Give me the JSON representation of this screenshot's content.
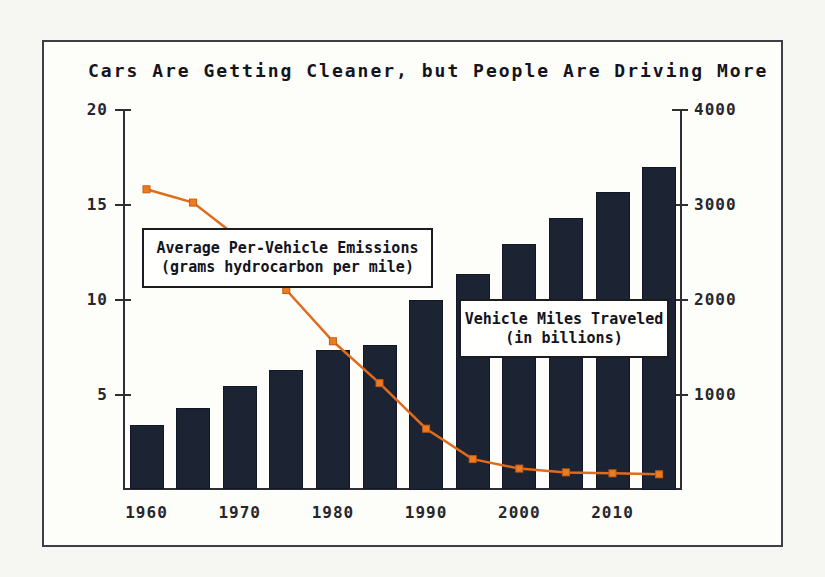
{
  "chart": {
    "title": "Cars Are Getting Cleaner, but People Are Driving More",
    "colors": {
      "bar": "#1c2433",
      "line": "#e06b1c",
      "marker_fill": "#ea7d22",
      "marker_stroke": "#c85a10",
      "axis": "#2e2e34",
      "frame_border": "#3e3e46",
      "text": "#14141c"
    },
    "annotations": [
      {
        "line1": "Average Per-Vehicle Emissions",
        "line2": "(grams hydrocarbon per mile)"
      },
      {
        "line1": "Vehicle Miles Traveled",
        "line2": "(in billions)"
      }
    ]
  },
  "chart_data": {
    "type": "combo",
    "title": "Cars Are Getting Cleaner, but People Are Driving More",
    "categories": [
      1960,
      1965,
      1970,
      1975,
      1980,
      1985,
      1990,
      1995,
      2000,
      2005,
      2010,
      2015
    ],
    "x_tick_labels": [
      "1960",
      "1970",
      "1980",
      "1990",
      "2000",
      "2010"
    ],
    "series": [
      {
        "name": "Average Per-Vehicle Emissions (grams hydrocarbon per mile)",
        "type": "line",
        "axis": "left",
        "values": [
          15.8,
          15.1,
          13.2,
          10.5,
          7.8,
          5.6,
          3.2,
          1.6,
          1.1,
          0.9,
          0.85,
          0.8
        ]
      },
      {
        "name": "Vehicle Miles Traveled (in billions)",
        "type": "bar",
        "axis": "right",
        "values": [
          680,
          860,
          1090,
          1260,
          1470,
          1520,
          2000,
          2270,
          2580,
          2860,
          3130,
          3400
        ]
      }
    ],
    "left_axis": {
      "label": "",
      "ylim": [
        0,
        20
      ],
      "ticks": [
        5,
        10,
        15,
        20
      ]
    },
    "right_axis": {
      "label": "",
      "ylim": [
        0,
        4000
      ],
      "ticks": [
        1000,
        2000,
        3000,
        4000
      ]
    },
    "grid": false,
    "legend": "none (in-plot annotation boxes instead)"
  }
}
